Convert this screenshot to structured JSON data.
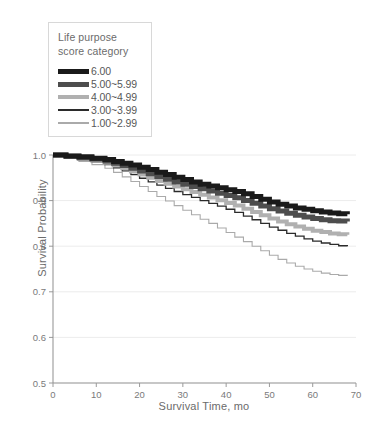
{
  "legend": {
    "title": "Life purpose\nscore category",
    "entries": [
      {
        "label": "6.00",
        "color": "#1a1a1a",
        "width": 5
      },
      {
        "label": "5.00~5.99",
        "color": "#4d4d4d",
        "width": 5
      },
      {
        "label": "4.00~4.99",
        "color": "#b0b0b0",
        "width": 4
      },
      {
        "label": "3.00~3.99",
        "color": "#2b2b2b",
        "width": 1.3
      },
      {
        "label": "1.00~2.99",
        "color": "#aaaaaa",
        "width": 1.1
      }
    ]
  },
  "chart_data": {
    "type": "line",
    "title": "",
    "xlabel": "Survival Time, mo",
    "ylabel": "Survival Probability",
    "xlim": [
      0,
      70
    ],
    "ylim": [
      0.5,
      1.0
    ],
    "xticks": [
      0,
      10,
      20,
      30,
      40,
      50,
      60,
      70
    ],
    "xtick_labels": [
      "0",
      "10",
      "20",
      "30",
      "40",
      "50",
      "60",
      "70"
    ],
    "yticks": [
      0.5,
      0.6,
      0.7,
      0.8,
      0.9,
      1.0
    ],
    "ytick_labels": [
      "0.5",
      "0.6",
      "0.7",
      "0.8",
      "0.9",
      "1.0"
    ],
    "grid": "horizontal",
    "legend_position": "top-left",
    "step": "post",
    "series": [
      {
        "name": "6.00",
        "color": "#1a1a1a",
        "width": 5,
        "x": [
          0,
          3,
          6,
          9,
          12,
          14,
          16,
          18,
          20,
          22,
          24,
          26,
          28,
          30,
          32,
          34,
          36,
          38,
          40,
          42,
          44,
          46,
          48,
          50,
          52,
          54,
          56,
          58,
          60,
          62,
          64,
          66,
          68
        ],
        "y": [
          1.0,
          0.998,
          0.996,
          0.993,
          0.99,
          0.986,
          0.982,
          0.978,
          0.973,
          0.968,
          0.962,
          0.957,
          0.951,
          0.946,
          0.941,
          0.936,
          0.932,
          0.928,
          0.924,
          0.92,
          0.915,
          0.909,
          0.903,
          0.897,
          0.892,
          0.888,
          0.884,
          0.881,
          0.878,
          0.875,
          0.873,
          0.871,
          0.87
        ]
      },
      {
        "name": "5.00~5.99",
        "color": "#4d4d4d",
        "width": 5,
        "x": [
          0,
          3,
          6,
          9,
          12,
          14,
          16,
          18,
          20,
          22,
          24,
          26,
          28,
          30,
          32,
          34,
          36,
          38,
          40,
          42,
          44,
          46,
          48,
          50,
          52,
          54,
          56,
          58,
          60,
          62,
          64,
          66,
          68
        ],
        "y": [
          1.0,
          0.997,
          0.994,
          0.991,
          0.987,
          0.982,
          0.977,
          0.971,
          0.965,
          0.959,
          0.953,
          0.947,
          0.941,
          0.936,
          0.931,
          0.926,
          0.921,
          0.916,
          0.911,
          0.906,
          0.9,
          0.894,
          0.888,
          0.882,
          0.877,
          0.872,
          0.868,
          0.864,
          0.861,
          0.858,
          0.856,
          0.855,
          0.854
        ]
      },
      {
        "name": "4.00~4.99",
        "color": "#b0b0b0",
        "width": 4,
        "x": [
          0,
          3,
          6,
          9,
          12,
          14,
          16,
          18,
          20,
          22,
          24,
          26,
          28,
          30,
          32,
          34,
          36,
          38,
          40,
          42,
          44,
          46,
          48,
          50,
          52,
          54,
          56,
          58,
          60,
          62,
          64,
          66,
          68
        ],
        "y": [
          1.0,
          0.996,
          0.992,
          0.988,
          0.983,
          0.977,
          0.971,
          0.964,
          0.957,
          0.95,
          0.943,
          0.937,
          0.931,
          0.925,
          0.919,
          0.913,
          0.907,
          0.901,
          0.895,
          0.889,
          0.882,
          0.875,
          0.868,
          0.861,
          0.854,
          0.848,
          0.843,
          0.838,
          0.834,
          0.831,
          0.828,
          0.826,
          0.825
        ]
      },
      {
        "name": "3.00~3.99",
        "color": "#2b2b2b",
        "width": 1.3,
        "x": [
          0,
          3,
          6,
          9,
          12,
          14,
          16,
          18,
          20,
          22,
          24,
          26,
          28,
          30,
          32,
          34,
          36,
          38,
          40,
          42,
          44,
          46,
          48,
          50,
          52,
          54,
          56,
          58,
          60,
          62,
          64,
          66,
          68
        ],
        "y": [
          1.0,
          0.995,
          0.99,
          0.985,
          0.979,
          0.972,
          0.965,
          0.957,
          0.949,
          0.941,
          0.934,
          0.927,
          0.92,
          0.913,
          0.907,
          0.9,
          0.894,
          0.888,
          0.881,
          0.874,
          0.866,
          0.858,
          0.85,
          0.842,
          0.835,
          0.828,
          0.822,
          0.816,
          0.811,
          0.807,
          0.804,
          0.801,
          0.8
        ]
      },
      {
        "name": "1.00~2.99",
        "color": "#aaaaaa",
        "width": 1.1,
        "x": [
          0,
          3,
          6,
          9,
          12,
          14,
          16,
          18,
          20,
          22,
          24,
          26,
          28,
          30,
          32,
          34,
          36,
          38,
          40,
          42,
          44,
          46,
          48,
          50,
          52,
          54,
          56,
          58,
          60,
          62,
          64,
          66,
          68
        ],
        "y": [
          1.0,
          0.993,
          0.986,
          0.979,
          0.971,
          0.962,
          0.952,
          0.942,
          0.931,
          0.92,
          0.909,
          0.899,
          0.889,
          0.879,
          0.869,
          0.859,
          0.85,
          0.84,
          0.83,
          0.82,
          0.81,
          0.8,
          0.79,
          0.78,
          0.771,
          0.763,
          0.756,
          0.75,
          0.745,
          0.741,
          0.738,
          0.736,
          0.735
        ]
      }
    ]
  }
}
